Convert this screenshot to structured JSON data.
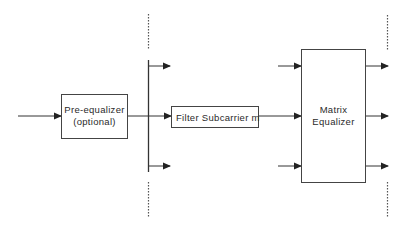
{
  "diagram": {
    "type": "block-diagram",
    "colors": {
      "stroke": "#333333",
      "background": "#ffffff"
    },
    "blocks": [
      {
        "id": "pre-equalizer",
        "lines": [
          "Pre-equalizer",
          "(optional)"
        ]
      },
      {
        "id": "filter",
        "lines": [
          "Filter Subcarrier m"
        ]
      },
      {
        "id": "matrix-equalizer",
        "lines": [
          "Matrix",
          "Equalizer"
        ]
      }
    ],
    "edges": [
      {
        "from": "input",
        "to": "pre-equalizer"
      },
      {
        "from": "pre-equalizer",
        "to": "bus"
      },
      {
        "from": "bus",
        "to": "branch-top"
      },
      {
        "from": "bus",
        "to": "filter"
      },
      {
        "from": "bus",
        "to": "branch-bottom"
      },
      {
        "from": "filter",
        "to": "matrix-equalizer"
      },
      {
        "from": "input-top",
        "to": "matrix-equalizer"
      },
      {
        "from": "input-bottom",
        "to": "matrix-equalizer"
      },
      {
        "from": "matrix-equalizer",
        "to": "output-top"
      },
      {
        "from": "matrix-equalizer",
        "to": "output-middle"
      },
      {
        "from": "matrix-equalizer",
        "to": "output-bottom"
      }
    ]
  }
}
